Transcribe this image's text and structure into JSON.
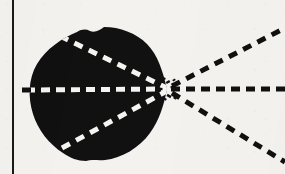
{
  "figure": {
    "background_color": "#f3f2ef",
    "ink_color": "#111111",
    "dash_light_color": "#f5f4f1",
    "margin_rule": {
      "label": "vertical margin rule",
      "x": 13,
      "y_top": 0,
      "y_bottom": 174,
      "width": 2,
      "color": "#1a1a1a"
    },
    "blob": {
      "label": "solid black lobed region",
      "fill": "#111111",
      "center_x": 96,
      "center_y": 94,
      "radius_x": 66,
      "radius_y": 67,
      "vertex_x": 168,
      "vertex_y": 89,
      "left_edge_x": 30,
      "top_edge_y": 28,
      "bottom_edge_y": 162,
      "path": "M 167 89 C 163 72, 158 55, 147 44 C 136 33, 120 27, 104 27 C 100 30, 95 33, 90 31 C 86 29, 82 29, 77 32 C 62 38, 46 49, 37 64 C 28 79, 28 98, 33 114 C 38 130, 49 144, 63 153 C 70 158, 78 161, 86 161 C 92 159, 98 161, 105 160 C 122 158, 139 148, 150 133 C 159 121, 164 105, 167 89 Z"
    },
    "rays": [
      {
        "name": "axis-ray-horizontal",
        "angle_deg": 0,
        "from_x": 22,
        "from_y": 90,
        "to_x": 285,
        "to_y": 89,
        "dash": "9 6",
        "stroke_width": 5,
        "inside_color": "#f5f4f1",
        "outside_color": "#111111"
      },
      {
        "name": "axis-ray-upper-left",
        "angle_deg": 28,
        "from_x": 60,
        "from_y": 36,
        "to_x": 167,
        "to_y": 88,
        "dash": "9 7",
        "stroke_width": 5,
        "inside_color": "#f5f4f1",
        "outside_color": "#111111"
      },
      {
        "name": "axis-ray-lower-left",
        "angle_deg": -28,
        "from_x": 62,
        "from_y": 148,
        "to_x": 167,
        "to_y": 91,
        "dash": "9 7",
        "stroke_width": 5,
        "inside_color": "#f5f4f1",
        "outside_color": "#111111"
      },
      {
        "name": "axis-ray-upper-right",
        "angle_deg": 26,
        "from_x": 172,
        "from_y": 86,
        "to_x": 285,
        "to_y": 28,
        "dash": "9 7",
        "stroke_width": 5,
        "inside_color": "#111111",
        "outside_color": "#111111"
      },
      {
        "name": "axis-ray-lower-right",
        "angle_deg": -26,
        "from_x": 172,
        "from_y": 93,
        "to_x": 285,
        "to_y": 162,
        "dash": "9 7",
        "stroke_width": 5,
        "inside_color": "#111111",
        "outside_color": "#111111"
      }
    ],
    "convergence_point": {
      "label": "vertex where all dashed rays meet",
      "x": 168,
      "y": 89
    }
  }
}
